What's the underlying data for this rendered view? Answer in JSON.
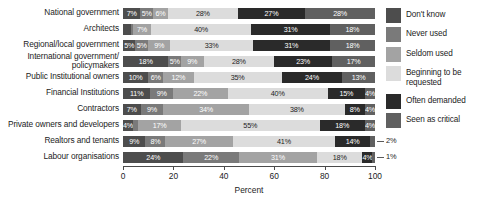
{
  "chart_data": {
    "type": "bar",
    "subtype": "stacked-horizontal-100pct",
    "title": "",
    "xlabel": "Percent",
    "ylabel": "",
    "xlim": [
      0,
      100
    ],
    "xticks": [
      "0",
      "20",
      "40",
      "60",
      "80",
      "100"
    ],
    "xtick_values": [
      0,
      20,
      40,
      60,
      80,
      100
    ],
    "grid": false,
    "legend_position": "right",
    "categories": [
      "National government",
      "Architects",
      "Regional/local government",
      "International government/ policymakers",
      "Public Institutional owners",
      "Financial Institutions",
      "Contractors",
      "Private owners and developers",
      "Realtors and tenants",
      "Labour organisations"
    ],
    "category_lines": [
      [
        "National government"
      ],
      [
        "Architects"
      ],
      [
        "Regional/local government"
      ],
      [
        "International government/",
        "policymakers"
      ],
      [
        "Public Institutional owners"
      ],
      [
        "Financial Institutions"
      ],
      [
        "Contractors"
      ],
      [
        "Private owners and developers"
      ],
      [
        "Realtors and tenants"
      ],
      [
        "Labour organisations"
      ]
    ],
    "series": [
      {
        "name": "Don't know",
        "color": "#4d4d4d",
        "values": [
          7,
          3,
          5,
          18,
          10,
          11,
          7,
          4,
          9,
          24
        ]
      },
      {
        "name": "Never used",
        "color": "#7a7a7a",
        "values": [
          5,
          1,
          5,
          5,
          6,
          9,
          9,
          2,
          8,
          22
        ]
      },
      {
        "name": "Seldom used",
        "color": "#a3a3a3",
        "values": [
          6,
          7,
          9,
          9,
          12,
          22,
          34,
          17,
          27,
          31
        ]
      },
      {
        "name": "Beginning to be requested",
        "color": "#dcdcdc",
        "values": [
          28,
          40,
          33,
          28,
          35,
          40,
          38,
          55,
          41,
          18
        ]
      },
      {
        "name": "Often demanded",
        "color": "#2a2a2a",
        "values": [
          27,
          31,
          31,
          23,
          24,
          15,
          8,
          18,
          14,
          4
        ]
      },
      {
        "name": "Seen as critical",
        "color": "#606060",
        "values": [
          28,
          18,
          18,
          17,
          13,
          4,
          4,
          4,
          2,
          1
        ]
      }
    ],
    "legend_entries": [
      "Don't know",
      "Never used",
      "Seldom used",
      "Beginning to be requested",
      "Often demanded",
      "Seen as critical"
    ],
    "legend_entry_lines": [
      [
        "Don't know"
      ],
      [
        "Never used"
      ],
      [
        "Seldom used"
      ],
      [
        "Beginning to be",
        "requested"
      ],
      [
        "Often demanded"
      ],
      [
        "Seen as critical"
      ]
    ],
    "value_labels": [
      [
        "7%",
        "5%",
        "6%",
        "28%",
        "27%",
        "28%"
      ],
      [
        "3%",
        "1%",
        "7%",
        "40%",
        "31%",
        "18%"
      ],
      [
        "5%",
        "5%",
        "9%",
        "33%",
        "31%",
        "18%"
      ],
      [
        "18%",
        "5%",
        "9%",
        "28%",
        "23%",
        "17%"
      ],
      [
        "10%",
        "6%",
        "12%",
        "35%",
        "24%",
        "13%"
      ],
      [
        "11%",
        "9%",
        "22%",
        "40%",
        "15%",
        "4%"
      ],
      [
        "7%",
        "9%",
        "34%",
        "38%",
        "8%",
        "4%"
      ],
      [
        "4%",
        "2%",
        "17%",
        "55%",
        "18%",
        "4%"
      ],
      [
        "9%",
        "8%",
        "27%",
        "41%",
        "14%",
        "2%"
      ],
      [
        "24%",
        "22%",
        "31%",
        "18%",
        "4%",
        "1%"
      ]
    ],
    "callouts": [
      {
        "row": 8,
        "label": "2%"
      },
      {
        "row": 9,
        "label": "1%"
      }
    ]
  }
}
